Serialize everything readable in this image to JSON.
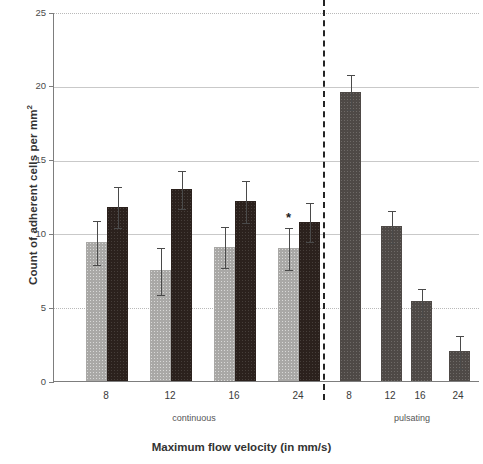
{
  "chart_data": {
    "type": "bar",
    "title": "",
    "xlabel": "Maximum flow velocity (in mm/s)",
    "ylabel": "Count of adherent cells per mm²",
    "ylim": [
      0,
      25
    ],
    "yticks": [
      0,
      5,
      10,
      15,
      20,
      25
    ],
    "grid": "horizontal",
    "legend": "none",
    "group_labels": [
      "continuous",
      "pulsating"
    ],
    "categories": [
      "8",
      "12",
      "16",
      "24",
      "8",
      "12",
      "16",
      "24"
    ],
    "series": [
      {
        "name": "light-gray bars (continuous only)",
        "color": "#a9a8a6",
        "values": [
          9.4,
          7.5,
          9.1,
          9.0,
          null,
          null,
          null,
          null
        ],
        "errors": [
          1.5,
          1.6,
          1.4,
          1.4,
          null,
          null,
          null,
          null
        ]
      },
      {
        "name": "dark bars (continuous)",
        "color": "#2b211d",
        "values": [
          11.8,
          13.0,
          12.2,
          10.8,
          null,
          null,
          null,
          null
        ],
        "errors": [
          1.4,
          1.3,
          1.4,
          1.3,
          null,
          null,
          null,
          null
        ]
      },
      {
        "name": "pulsating bars",
        "color": "#4e4946",
        "values": [
          null,
          null,
          null,
          null,
          19.6,
          10.5,
          5.4,
          2.0
        ],
        "errors": [
          null,
          null,
          null,
          null,
          1.2,
          1.1,
          0.9,
          1.1
        ]
      }
    ],
    "annotations": [
      {
        "text": "*",
        "category": "24",
        "group": "continuous",
        "series": "light-gray bars (continuous only)",
        "value": 9.0
      }
    ],
    "divider": {
      "style": "dashed",
      "between": [
        "continuous",
        "pulsating"
      ]
    }
  },
  "axis": {
    "y_tick_labels": [
      "25",
      "20",
      "15",
      "10",
      "5",
      "0"
    ],
    "x_tick_labels": [
      "8",
      "12",
      "16",
      "24",
      "8",
      "12",
      "16",
      "24"
    ],
    "group_labels": [
      "continuous",
      "pulsating"
    ],
    "x_title": "Maximum flow velocity (in mm/s)",
    "y_title_main": "Count of adherent cells per mm",
    "y_title_exp": "2"
  },
  "marks": {
    "significance": "*"
  }
}
